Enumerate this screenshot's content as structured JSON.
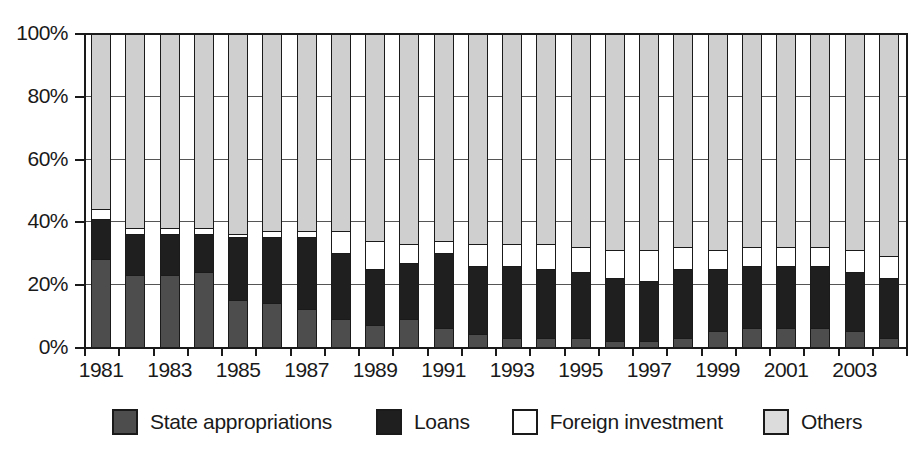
{
  "chart_data": {
    "type": "bar",
    "subtype": "stacked-percentage",
    "title": "",
    "xlabel": "",
    "ylabel": "",
    "ylim": [
      0,
      100
    ],
    "yunit": "%",
    "grid": true,
    "legend_position": "bottom",
    "categories": [
      "1981",
      "1982",
      "1983",
      "1984",
      "1985",
      "1986",
      "1987",
      "1988",
      "1989",
      "1990",
      "1991",
      "1992",
      "1993",
      "1994",
      "1995",
      "1996",
      "1997",
      "1998",
      "1999",
      "2000",
      "2001",
      "2002",
      "2003",
      "2004"
    ],
    "x_tick_labels": [
      "1981",
      "1983",
      "1985",
      "1987",
      "1989",
      "1991",
      "1993",
      "1995",
      "1997",
      "1999",
      "2001",
      "2003"
    ],
    "y_tick_labels": [
      "0%",
      "20%",
      "40%",
      "60%",
      "80%",
      "100%"
    ],
    "y_tick_values": [
      0,
      20,
      40,
      60,
      80,
      100
    ],
    "series": [
      {
        "name": "State appropriations",
        "color": "#4d4d4d",
        "values": [
          28,
          23,
          23,
          24,
          15,
          14,
          12,
          9,
          7,
          9,
          6,
          4,
          3,
          3,
          3,
          2,
          2,
          3,
          5,
          6,
          6,
          6,
          5,
          3
        ]
      },
      {
        "name": "Loans",
        "color": "#1f1f1f",
        "values": [
          13,
          13,
          13,
          12,
          20,
          21,
          23,
          21,
          18,
          18,
          24,
          22,
          23,
          22,
          21,
          20,
          19,
          22,
          20,
          20,
          20,
          20,
          19,
          19
        ]
      },
      {
        "name": "Foreign investment",
        "color": "#ffffff",
        "values": [
          3,
          2,
          2,
          2,
          1,
          2,
          2,
          7,
          9,
          6,
          4,
          7,
          7,
          8,
          8,
          9,
          10,
          7,
          6,
          6,
          6,
          6,
          7,
          7
        ]
      },
      {
        "name": "Others",
        "color": "#cfcfcf",
        "values": [
          56,
          62,
          62,
          62,
          64,
          63,
          63,
          63,
          66,
          67,
          66,
          67,
          67,
          67,
          68,
          69,
          69,
          68,
          69,
          68,
          68,
          68,
          69,
          71
        ]
      }
    ]
  },
  "legend": {
    "items": [
      {
        "label": "State appropriations",
        "swatch": "dark-gray-swatch"
      },
      {
        "label": "Loans",
        "swatch": "black-swatch"
      },
      {
        "label": "Foreign investment",
        "swatch": "white-swatch"
      },
      {
        "label": "Others",
        "swatch": "light-gray-swatch"
      }
    ]
  }
}
